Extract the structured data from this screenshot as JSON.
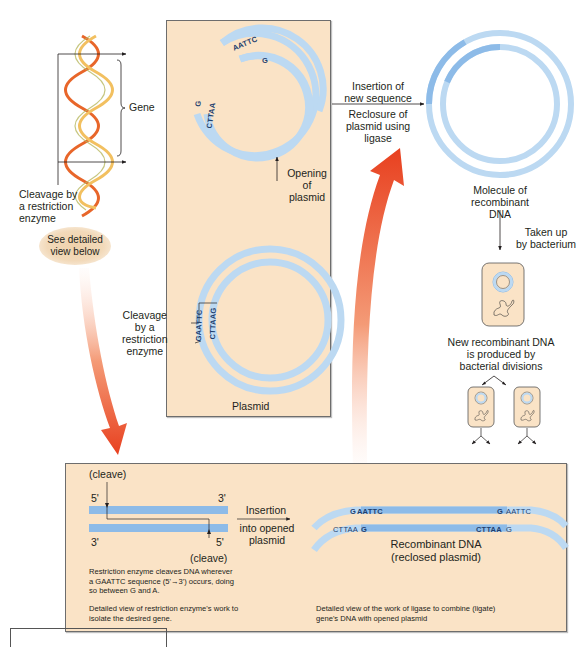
{
  "gene_section": {
    "gene_label": "Gene",
    "cleavage_label": "Cleavage by\na restriction\nenzyme",
    "bubble_label": "See detailed\nview below"
  },
  "plasmid_panel": {
    "open_outer_seq": "AATTC",
    "open_outer_end": "G",
    "open_inner_seq": "CTTAA",
    "open_inner_end": "G",
    "opening_label": "Opening of\nplasmid",
    "closed_outer_seq": "GAATTC",
    "closed_inner_seq": "CTTAAG",
    "cleavage_label": "Cleavage\nby a\nrestriction\nenzyme",
    "plasmid_label": "Plasmid"
  },
  "insertion_arrow": {
    "top_label": "Insertion of\nnew sequence",
    "bottom_label": "Reclosure of\nplasmid using\nligase"
  },
  "recombinant_section": {
    "molecule_label": "Molecule of\nrecombinant\nDNA",
    "taken_up_label": "Taken up\nby bacterium",
    "division_label": "New recombinant DNA\nis produced by\nbacterial divisions"
  },
  "detail_panel": {
    "cleave_top": "(cleave)",
    "cleave_bottom": "(cleave)",
    "top_5": "5'",
    "top_3": "3'",
    "bottom_3": "3'",
    "bottom_5": "5'",
    "insertion_label": "Insertion",
    "insertion_sub": "into opened\nplasmid",
    "enzyme_note": "Restriction enzyme cleaves DNA wherever\na GAATTC sequence (5'→3') occurs, doing\nso between G and A.",
    "enzyme_caption": "Detailed view of restriction enzyme's work to\nisolate the desired gene.",
    "seq_top_left_g": "G",
    "seq_top_left": "AATTC",
    "seq_top_right_g": "G",
    "seq_top_right": "AATTC",
    "seq_bottom_left": "CTTAA",
    "seq_bottom_left_g": "G",
    "seq_bottom_right": "CTTAA",
    "seq_bottom_right_g": "G",
    "recombinant_title": "Recombinant DNA\n(reclosed plasmid)",
    "ligase_caption": "Detailed view of the work of ligase to combine (ligate)\ngene's DNA with opened plasmid"
  },
  "colors": {
    "panel_bg": "#fae3c6",
    "dna_light_blue": "#bcd9f2",
    "dna_mid_blue": "#8dbbe8",
    "gene_blue": "#6fa5dc",
    "arrow_red": "#e8401f",
    "helix_orange": "#e8662a",
    "helix_yellow": "#f2c060"
  }
}
